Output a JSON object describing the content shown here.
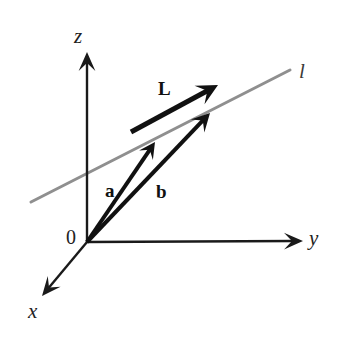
{
  "figure": {
    "width": 338,
    "height": 341,
    "background_color": "#ffffff"
  },
  "colors": {
    "axis": "#1a1a1a",
    "vector": "#111111",
    "line_l": "#8f8f8f",
    "text": "#222222"
  },
  "axes": [
    {
      "name": "z-axis",
      "label": "z",
      "from": [
        87,
        242
      ],
      "to": [
        87,
        52
      ],
      "arrow": true
    },
    {
      "name": "y-axis",
      "label": "y",
      "from": [
        87,
        242
      ],
      "to": [
        303,
        241
      ],
      "arrow": true
    },
    {
      "name": "x-axis",
      "label": "x",
      "from": [
        87,
        242
      ],
      "to": [
        42,
        296
      ],
      "arrow": true
    }
  ],
  "origin": {
    "label": "0",
    "point": [
      87,
      242
    ]
  },
  "line": {
    "name": "line-l",
    "label": "l",
    "from": [
      31,
      202
    ],
    "to": [
      290,
      70
    ],
    "color": "#8f8f8f",
    "width": 3
  },
  "vectors": [
    {
      "name": "vector-a",
      "label": "a",
      "from": [
        87,
        242
      ],
      "to": [
        155,
        142
      ],
      "color": "#111111",
      "width": 4
    },
    {
      "name": "vector-b",
      "label": "b",
      "from": [
        87,
        242
      ],
      "to": [
        210,
        113
      ],
      "color": "#111111",
      "width": 4
    },
    {
      "name": "vector-L",
      "label": "L",
      "from": [
        131,
        132
      ],
      "to": [
        218,
        85
      ],
      "color": "#111111",
      "width": 5
    }
  ]
}
